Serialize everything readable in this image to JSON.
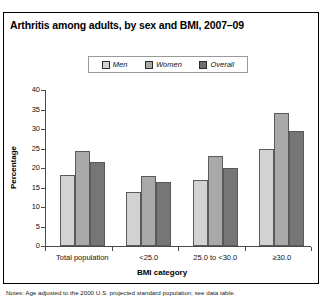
{
  "title": "Arthritis among adults, by sex and BMI, 2007–09",
  "legend": {
    "position": "top-center",
    "items": [
      {
        "label": "Men",
        "color": "#d2d2d2"
      },
      {
        "label": "Women",
        "color": "#a9a9a9"
      },
      {
        "label": "Overall",
        "color": "#767676"
      }
    ]
  },
  "footnote": "Notes: Age adjusted to the 2000 U.S. projected standard population; see data table.",
  "chart_data": {
    "type": "bar",
    "title": "Arthritis among adults, by sex and BMI, 2007–09",
    "xlabel": "BMI category",
    "ylabel": "Percentage",
    "ylim": [
      0,
      40
    ],
    "yticks": [
      0,
      5,
      10,
      15,
      20,
      25,
      30,
      35,
      40
    ],
    "grid": false,
    "legend_position": "top-center",
    "categories": [
      "Total population",
      "<25.0",
      "25.0 to <30.0",
      "≥30.0"
    ],
    "series": [
      {
        "name": "Men",
        "color": "#d2d2d2",
        "values": [
          18.2,
          13.9,
          16.9,
          25.0
        ]
      },
      {
        "name": "Women",
        "color": "#a9a9a9",
        "values": [
          24.3,
          18.0,
          23.0,
          34.0
        ]
      },
      {
        "name": "Overall",
        "color": "#767676",
        "values": [
          21.5,
          16.3,
          19.9,
          29.6
        ]
      }
    ]
  }
}
